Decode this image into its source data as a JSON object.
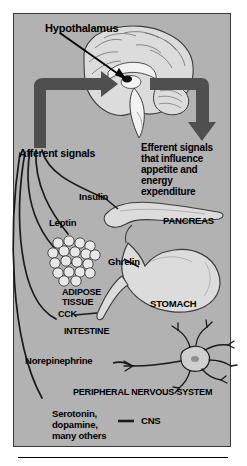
{
  "figure": {
    "background_color": "#b2b2b2",
    "border_color": "#3a3a3a",
    "arrow_color": "#4f4f4f",
    "line_color": "#1a1a1a",
    "organ_fill": "#dcdcdc"
  },
  "labels": {
    "hypothalamus": "Hypothalamus",
    "afferent": "Afferent signals",
    "efferent_line1": "Efferent signals",
    "efferent_line2": "that influence",
    "efferent_line3": "appetite and",
    "efferent_line4": "energy",
    "efferent_line5": "expenditure",
    "insulin": "Insulin",
    "pancreas": "PANCREAS",
    "leptin": "Leptin",
    "ghrelin": "Ghrelin",
    "adipose_line1": "ADIPOSE",
    "adipose_line2": "TISSUE",
    "stomach": "STOMACH",
    "cck": "CCK",
    "intestine": "INTESTINE",
    "norepinephrine": "Norepinephrine",
    "pns": "PERIPHERAL NERVOUS SYSTEM",
    "cns_line1": "Serotonin,",
    "cns_line2": "dopamine,",
    "cns_line3": "many others",
    "cns": "CNS"
  },
  "signal_sources": [
    {
      "name": "Insulin",
      "organ": "PANCREAS"
    },
    {
      "name": "Leptin",
      "organ": "ADIPOSE TISSUE"
    },
    {
      "name": "Ghrelin",
      "organ": "STOMACH"
    },
    {
      "name": "CCK",
      "organ": "INTESTINE"
    },
    {
      "name": "Norepinephrine",
      "organ": "PERIPHERAL NERVOUS SYSTEM"
    },
    {
      "name": "Serotonin, dopamine, many others",
      "organ": "CNS"
    }
  ],
  "icons": {
    "brain": "brain-sagittal-icon",
    "pancreas": "pancreas-icon",
    "adipose": "adipose-cells-icon",
    "stomach": "stomach-icon",
    "intestine": "intestine-icon",
    "neuron": "neuron-icon",
    "pointer": "pointer-arrow-icon",
    "afferent_arrow": "afferent-arrow-icon",
    "efferent_arrow": "efferent-arrow-icon"
  }
}
